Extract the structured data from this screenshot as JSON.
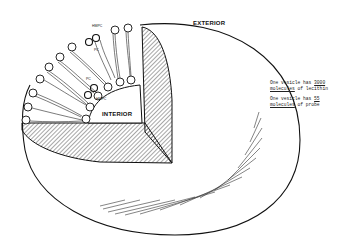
{
  "diagram": {
    "labels": {
      "exterior": "EXTERIOR",
      "interior": "INTERIOR"
    },
    "probe_labels": [
      "HMPC",
      "PC",
      "PC",
      "HMPC"
    ],
    "notes": [
      {
        "prefix": "One vesicle has ",
        "number": "3000",
        "line2_underlined": "molecules",
        "line2_rest": " of lecithin"
      },
      {
        "prefix": "One vesicle has ",
        "number": "55",
        "line2_underlined": "molecules",
        "line2_rest": " of probe"
      }
    ],
    "colors": {
      "stroke": "#111111",
      "background": "#ffffff",
      "hatch": "#222222"
    }
  }
}
